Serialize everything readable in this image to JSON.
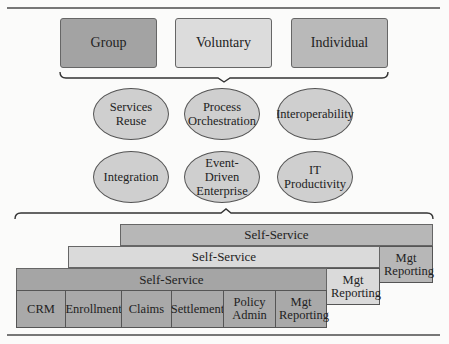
{
  "top_row": [
    {
      "label": "Group",
      "color": "#a3a3a3"
    },
    {
      "label": "Voluntary",
      "color": "#dcdcdc"
    },
    {
      "label": "Individual",
      "color": "#b9b9b9"
    }
  ],
  "capabilities": [
    {
      "label": "Services Reuse"
    },
    {
      "label": "Process Orchestration"
    },
    {
      "label": "Interoperability"
    },
    {
      "label": "Integration"
    },
    {
      "label": "Event-Driven Enterprise"
    },
    {
      "label": "IT Productivity"
    }
  ],
  "layers": {
    "back": {
      "self_service": "Self-Service",
      "mgt_reporting": "Mgt Reporting",
      "color": "#b7b7b7"
    },
    "middle": {
      "self_service": "Self-Service",
      "mgt_reporting": "Mgt Reporting",
      "color": "#dadada"
    },
    "front": {
      "self_service": "Self-Service",
      "color": "#a5a5a5",
      "modules": [
        "CRM",
        "Enrollment",
        "Claims",
        "Settlement",
        "Policy Admin",
        "Mgt Reporting"
      ]
    }
  }
}
